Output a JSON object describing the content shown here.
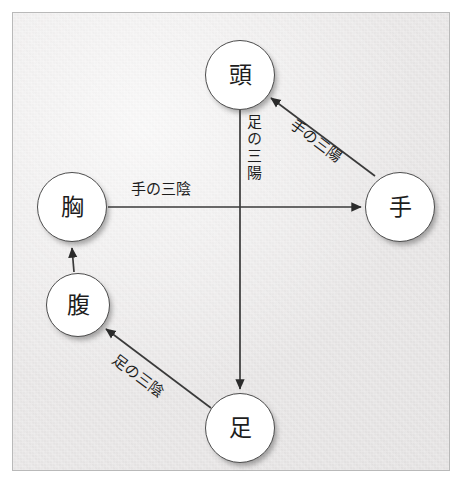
{
  "diagram": {
    "title": "",
    "panel": {
      "background_color": "#e9e7e7",
      "border_color": "#b9b9b9"
    },
    "node_style": {
      "fill_color": "#ffffff",
      "stroke_color": "#4d4d4d",
      "text_color": "#1d1d1d"
    },
    "edge_style": {
      "line_color": "#3a3a3a",
      "arrow_color": "#2b2b2b"
    },
    "nodes": [
      {
        "id": "atama",
        "label": "頭",
        "cx": 240,
        "cy": 75,
        "r": 35
      },
      {
        "id": "te",
        "label": "手",
        "cx": 400,
        "cy": 207,
        "r": 35
      },
      {
        "id": "mune",
        "label": "胸",
        "cx": 72,
        "cy": 207,
        "r": 35
      },
      {
        "id": "hara",
        "label": "腹",
        "cx": 78,
        "cy": 305,
        "r": 32
      },
      {
        "id": "ashi",
        "label": "足",
        "cx": 240,
        "cy": 428,
        "r": 35
      }
    ],
    "edges": [
      {
        "id": "mune-te",
        "from": "胸",
        "to": "手",
        "label": "手の三陰",
        "orientation": "horizontal"
      },
      {
        "id": "te-atama",
        "from": "手",
        "to": "頭",
        "label": "手の三陽",
        "orientation": "diagonal-up-left"
      },
      {
        "id": "atama-ashi",
        "from": "頭",
        "to": "足",
        "label": "足の三陽",
        "orientation": "vertical-down"
      },
      {
        "id": "ashi-hara",
        "from": "足",
        "to": "腹",
        "label": "足の三陰",
        "orientation": "diagonal-up-left"
      },
      {
        "id": "hara-mune",
        "from": "腹",
        "to": "胸",
        "label": "",
        "orientation": "vertical-up"
      }
    ]
  }
}
